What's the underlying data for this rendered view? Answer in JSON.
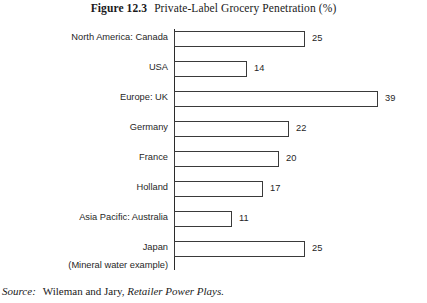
{
  "title": {
    "figure_number": "Figure 12.3",
    "text": "Private-Label Grocery Penetration (%)"
  },
  "source": {
    "label": "Source:",
    "authors": "Wileman and Jary,",
    "work": "Retailer Power Plays."
  },
  "annotations": {
    "japan_note": "(Mineral water example)"
  },
  "chart_data": {
    "type": "bar",
    "orientation": "horizontal",
    "title": "Private-Label Grocery Penetration (%)",
    "xlabel": "",
    "ylabel": "",
    "grid": false,
    "legend": "none",
    "xlim": [
      0,
      39
    ],
    "categories": [
      "North America: Canada",
      "USA",
      "Europe: UK",
      "Germany",
      "France",
      "Holland",
      "Asia Pacific: Australia",
      "Japan"
    ],
    "values": [
      25,
      14,
      39,
      22,
      20,
      17,
      11,
      25
    ],
    "value_labels": [
      "25",
      "14",
      "39",
      "22",
      "20",
      "17",
      "11",
      "25"
    ]
  }
}
